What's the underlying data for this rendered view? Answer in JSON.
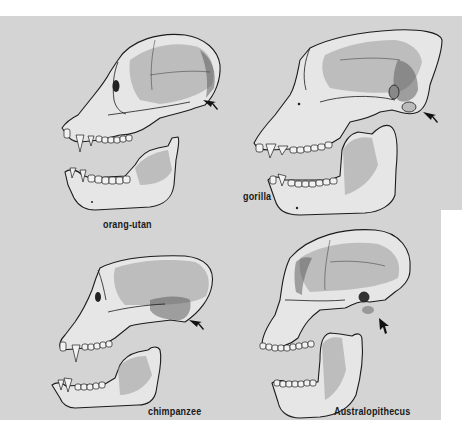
{
  "figure": {
    "background_color": "#d4d4d4",
    "panels": [
      {
        "id": "orang-utan",
        "label": "orang-utan",
        "position": "top-left",
        "has_arrow": true
      },
      {
        "id": "gorilla",
        "label": "gorilla",
        "position": "top-right",
        "has_arrow": true
      },
      {
        "id": "chimpanzee",
        "label": "chimpanzee",
        "position": "bottom-left",
        "has_arrow": true
      },
      {
        "id": "australopithecus",
        "label": "Australopithecus",
        "position": "bottom-right",
        "has_arrow": true
      }
    ]
  }
}
